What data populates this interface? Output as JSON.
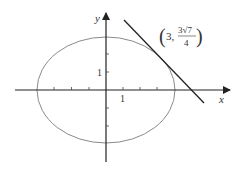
{
  "diagram": {
    "x_axis_label": "x",
    "y_axis_label": "y",
    "x_tick_label": "1",
    "y_tick_label": "1",
    "point_label": {
      "open": "(",
      "x": "3,",
      "numerator": "3√7",
      "denominator": "4",
      "close": ")"
    },
    "ellipse": {
      "semi_major_x": 4,
      "semi_minor_y": 3,
      "color": "#888888"
    },
    "tangent_line": {
      "color": "#222222",
      "point": [
        3,
        1.984
      ]
    },
    "axis_color": "#222222"
  }
}
